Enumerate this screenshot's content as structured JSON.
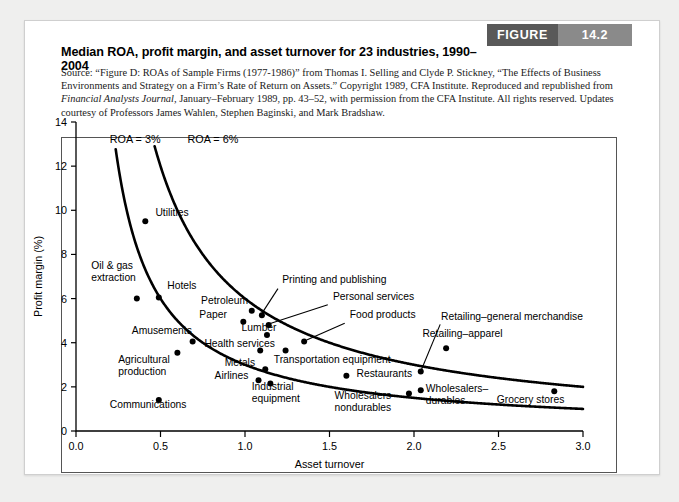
{
  "figure": {
    "word": "FIGURE",
    "number": "14.2"
  },
  "header": {
    "title": "Median ROA, profit margin, and asset turnover for 23 industries, 1990–2004",
    "source_line1": "Source: “Figure D: ROAs of Sample Firms (1977-1986)” from Thomas I. Selling and Clyde P. Stickney, “The Effects of",
    "source_line2": "Business Environments and Strategy on a Firm’s Rate of Return on Assets.” Copyright 1989, CFA Institute. Reproduced and",
    "source_line3_a": "republished from ",
    "source_line3_italic": "Financial Analysts Journal,",
    "source_line3_b": " January–February 1989, pp. 43–52, with permission from the CFA Institute. All",
    "source_line4": "rights reserved. Updates courtesy of Professors James Wahlen, Stephen Baginski, and Mark Bradshaw."
  },
  "chart_data": {
    "type": "scatter",
    "title": "Median ROA, profit margin, and asset turnover for 23 industries, 1990–2004",
    "xlabel": "Asset turnover",
    "ylabel": "Profit margin (%)",
    "xlim": [
      0.0,
      3.0
    ],
    "ylim": [
      0,
      14
    ],
    "xticks": [
      "0.0",
      "0.5",
      "1.0",
      "1.5",
      "2.0",
      "2.5",
      "3.0"
    ],
    "xtick_values": [
      0.0,
      0.5,
      1.0,
      1.5,
      2.0,
      2.5,
      3.0
    ],
    "yticks": [
      "0",
      "2",
      "4",
      "6",
      "8",
      "10",
      "12",
      "14"
    ],
    "ytick_values": [
      0,
      2,
      4,
      6,
      8,
      10,
      12,
      14
    ],
    "grid": false,
    "legend": "none",
    "curves": [
      {
        "name": "ROA = 3%",
        "roa": 3,
        "label": "ROA = 3%"
      },
      {
        "name": "ROA = 6%",
        "roa": 6,
        "label": "ROA = 6%"
      }
    ],
    "points": [
      {
        "label": "Utilities",
        "x": 0.41,
        "y": 9.5,
        "lx": 0.47,
        "ly": 9.75,
        "anchor": "start"
      },
      {
        "label": "Oil & gas\nextraction",
        "x": 0.36,
        "y": 6.0,
        "lx": 0.09,
        "ly": 7.35,
        "anchor": "start"
      },
      {
        "label": "Hotels",
        "x": 0.49,
        "y": 6.05,
        "lx": 0.54,
        "ly": 6.45,
        "anchor": "start"
      },
      {
        "label": "Amusements",
        "x": 0.69,
        "y": 4.05,
        "lx": 0.33,
        "ly": 4.4,
        "anchor": "start"
      },
      {
        "label": "Agricultural\nproduction",
        "x": 0.6,
        "y": 3.55,
        "lx": 0.25,
        "ly": 3.1,
        "anchor": "start"
      },
      {
        "label": "Communications",
        "x": 0.49,
        "y": 1.4,
        "lx": 0.2,
        "ly": 1.05,
        "anchor": "start"
      },
      {
        "label": "Petroleum",
        "x": 1.04,
        "y": 5.45,
        "lx": 0.74,
        "ly": 5.75,
        "anchor": "start"
      },
      {
        "label": "Paper",
        "x": 0.99,
        "y": 4.95,
        "lx": 0.73,
        "ly": 5.1,
        "anchor": "start"
      },
      {
        "label": "Printing and publishing",
        "x": 1.1,
        "y": 5.25,
        "lx": 1.22,
        "ly": 6.7,
        "anchor": "start"
      },
      {
        "label": "Personal services",
        "x": 1.14,
        "y": 4.8,
        "lx": 1.52,
        "ly": 5.95,
        "anchor": "start"
      },
      {
        "label": "Lumber",
        "x": 1.13,
        "y": 4.35,
        "lx": 0.98,
        "ly": 4.55,
        "anchor": "start"
      },
      {
        "label": "Food products",
        "x": 1.35,
        "y": 4.05,
        "lx": 1.62,
        "ly": 5.1,
        "anchor": "start"
      },
      {
        "label": "Health services",
        "x": 1.09,
        "y": 3.65,
        "lx": 0.76,
        "ly": 3.8,
        "anchor": "start"
      },
      {
        "label": "Transportation equipment",
        "x": 1.24,
        "y": 3.65,
        "lx": 1.17,
        "ly": 3.1,
        "anchor": "start"
      },
      {
        "label": "Metals",
        "x": 1.12,
        "y": 2.8,
        "lx": 0.88,
        "ly": 2.95,
        "anchor": "start"
      },
      {
        "label": "Airlines",
        "x": 1.08,
        "y": 2.3,
        "lx": 0.82,
        "ly": 2.35,
        "anchor": "start"
      },
      {
        "label": "Industrial\nequipment",
        "x": 1.15,
        "y": 2.15,
        "lx": 1.04,
        "ly": 1.85,
        "anchor": "start"
      },
      {
        "label": "Restaurants",
        "x": 1.6,
        "y": 2.5,
        "lx": 1.66,
        "ly": 2.45,
        "anchor": "start"
      },
      {
        "label": "Wholesalers–\nnondurables",
        "x": 1.97,
        "y": 1.7,
        "lx": 1.53,
        "ly": 1.45,
        "anchor": "start"
      },
      {
        "label": "Wholesalers–\ndurables",
        "x": 2.04,
        "y": 1.85,
        "lx": 2.07,
        "ly": 1.75,
        "anchor": "start"
      },
      {
        "label": "Retailing–general merchandise",
        "x": 2.04,
        "y": 2.7,
        "lx": 2.16,
        "ly": 5.05,
        "anchor": "start"
      },
      {
        "label": "Retailing–apparel",
        "x": 2.19,
        "y": 3.75,
        "lx": 2.05,
        "ly": 4.25,
        "anchor": "start"
      },
      {
        "label": "Grocery stores",
        "x": 2.83,
        "y": 1.8,
        "lx": 2.49,
        "ly": 1.25,
        "anchor": "start"
      }
    ],
    "curve_label_positions": [
      {
        "label": "ROA = 3%",
        "lx": 0.2,
        "ly": 13.05
      },
      {
        "label": "ROA = 6%",
        "lx": 0.66,
        "ly": 13.05
      }
    ],
    "leader_lines": [
      {
        "from_label": "Printing and publishing",
        "x1": 1.195,
        "y1": 6.45,
        "x2": 1.1,
        "y2": 5.33
      },
      {
        "from_label": "Personal services",
        "x1": 1.49,
        "y1": 5.72,
        "x2": 1.145,
        "y2": 4.86
      },
      {
        "from_label": "Food products",
        "x1": 1.59,
        "y1": 4.88,
        "x2": 1.365,
        "y2": 4.12
      },
      {
        "from_label": "Retailing–general merchandise",
        "x1": 2.155,
        "y1": 4.83,
        "x2": 2.045,
        "y2": 2.8
      }
    ]
  }
}
